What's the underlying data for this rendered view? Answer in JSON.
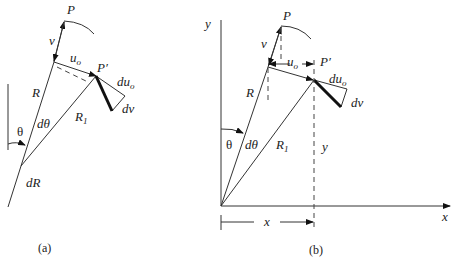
{
  "figure_a": {
    "caption": "(a)",
    "labels": {
      "P": "P",
      "v": "v",
      "u_o": "u",
      "u_o_sub": "o",
      "P_prime": "P′",
      "du_o": "du",
      "du_o_sub": "o",
      "dv": "dv",
      "R": "R",
      "R1": "R",
      "R1_sub": "1",
      "dtheta": "dθ",
      "theta": "θ",
      "dR": "dR"
    }
  },
  "figure_b": {
    "caption": "(b)",
    "labels": {
      "P": "P",
      "v": "v",
      "u_o": "u",
      "u_o_sub": "o",
      "P_prime": "P′",
      "du_o": "du",
      "du_o_sub": "o",
      "dv": "dv",
      "R": "R",
      "R1": "R",
      "R1_sub": "1",
      "dtheta": "dθ",
      "theta": "θ",
      "y_dim": "y",
      "x_dim": "x",
      "x_axis": "x",
      "y_axis": "y"
    }
  }
}
